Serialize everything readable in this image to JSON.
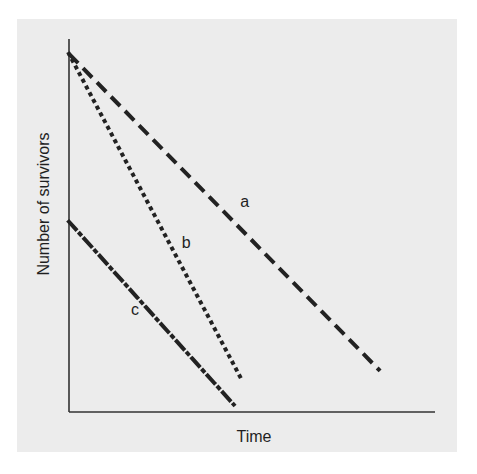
{
  "chart_data": {
    "type": "line",
    "title": "",
    "xlabel": "Time",
    "ylabel": "Number of survivors",
    "grid": false,
    "legend": "none (inline line labels)",
    "xlim": [
      0,
      1
    ],
    "ylim": [
      0,
      1
    ],
    "ticks": "none",
    "series": [
      {
        "name": "a",
        "style": "dashed",
        "x": [
          0,
          0.85
        ],
        "y": [
          0.96,
          0.11
        ]
      },
      {
        "name": "b",
        "style": "dotted",
        "x": [
          0,
          0.47
        ],
        "y": [
          0.96,
          0.09
        ]
      },
      {
        "name": "c",
        "style": "dash-dot",
        "x": [
          0,
          0.45
        ],
        "y": [
          0.51,
          0.02
        ]
      }
    ],
    "annotations": [
      {
        "text": "a",
        "x": 0.48,
        "y": 0.55
      },
      {
        "text": "b",
        "x": 0.32,
        "y": 0.44
      },
      {
        "text": "c",
        "x": 0.18,
        "y": 0.26
      }
    ]
  },
  "colors": {
    "panel": "#ececec",
    "line": "#222222",
    "axis": "#333333"
  }
}
